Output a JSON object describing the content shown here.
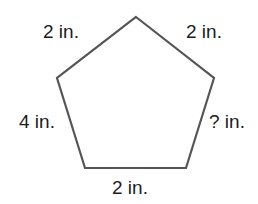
{
  "figure": {
    "kind": "polygon-side-length-diagram",
    "shape_name": "pentagon",
    "stroke_color": "#555555",
    "fill_color": "#ffffff",
    "background_color": "#ffffff",
    "text_color": "#1c1c1c",
    "unit": "in.",
    "unknown_marker": "?"
  },
  "polygon": {
    "vertices": [
      {
        "name": "apex",
        "x": 136,
        "y": 17
      },
      {
        "name": "upper-right",
        "x": 214,
        "y": 78
      },
      {
        "name": "lower-right",
        "x": 186,
        "y": 168
      },
      {
        "name": "lower-left",
        "x": 85,
        "y": 168
      },
      {
        "name": "upper-left",
        "x": 57,
        "y": 78
      }
    ],
    "points_attr": "136,17 214,78 186,168 85,168 57,78"
  },
  "labels": {
    "top_left": "2 in.",
    "top_right": "2 in.",
    "left": "4 in.",
    "right": "? in.",
    "bottom": "2 in."
  },
  "sides": [
    {
      "position": "top-left",
      "label": "2 in.",
      "value": 2,
      "known": true
    },
    {
      "position": "top-right",
      "label": "2 in.",
      "value": 2,
      "known": true
    },
    {
      "position": "right",
      "label": "? in.",
      "value": null,
      "known": false
    },
    {
      "position": "bottom",
      "label": "2 in.",
      "value": 2,
      "known": true
    },
    {
      "position": "left",
      "label": "4 in.",
      "value": 4,
      "known": true
    }
  ]
}
